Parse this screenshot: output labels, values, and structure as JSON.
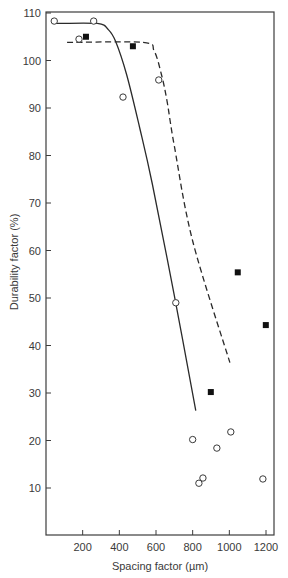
{
  "chart_data": {
    "type": "scatter",
    "title": "",
    "xlabel": "Spacing factor (µm)",
    "ylabel": "Durability factor (%)",
    "xlim": [
      0,
      1250
    ],
    "ylim": [
      0,
      110
    ],
    "x_ticks": [
      200,
      400,
      600,
      800,
      1000,
      1200
    ],
    "y_ticks": [
      10,
      20,
      30,
      40,
      50,
      60,
      70,
      80,
      90,
      100,
      110
    ],
    "grid": false,
    "legend": null,
    "series": [
      {
        "name": "open-circles",
        "marker": "open-circle",
        "points": [
          {
            "x": 45,
            "y": 108.3
          },
          {
            "x": 260,
            "y": 108.3
          },
          {
            "x": 180,
            "y": 104.5
          },
          {
            "x": 420,
            "y": 92.3
          },
          {
            "x": 615,
            "y": 95.9
          },
          {
            "x": 708,
            "y": 49.0
          },
          {
            "x": 800,
            "y": 20.2
          },
          {
            "x": 1008,
            "y": 21.8
          },
          {
            "x": 932,
            "y": 18.4
          },
          {
            "x": 856,
            "y": 12.1
          },
          {
            "x": 834,
            "y": 11.0
          },
          {
            "x": 1183,
            "y": 11.9
          }
        ]
      },
      {
        "name": "filled-squares",
        "marker": "filled-square",
        "points": [
          {
            "x": 218,
            "y": 105.0
          },
          {
            "x": 474,
            "y": 103.0
          },
          {
            "x": 1046,
            "y": 55.4
          },
          {
            "x": 1199,
            "y": 44.3
          },
          {
            "x": 899,
            "y": 30.2
          }
        ]
      }
    ],
    "curves": [
      {
        "name": "solid-fit-curve",
        "style": "solid",
        "points": [
          {
            "x": 45,
            "y": 107.8
          },
          {
            "x": 280,
            "y": 107.8
          },
          {
            "x": 340,
            "y": 106.5
          },
          {
            "x": 380,
            "y": 104.0
          },
          {
            "x": 440,
            "y": 97.0
          },
          {
            "x": 510,
            "y": 86.0
          },
          {
            "x": 580,
            "y": 74.0
          },
          {
            "x": 700,
            "y": 50.5
          },
          {
            "x": 817,
            "y": 26.3
          }
        ]
      },
      {
        "name": "dashed-fit-curve",
        "style": "dashed",
        "points": [
          {
            "x": 115,
            "y": 103.8
          },
          {
            "x": 530,
            "y": 103.8
          },
          {
            "x": 590,
            "y": 102.0
          },
          {
            "x": 630,
            "y": 97.0
          },
          {
            "x": 660,
            "y": 91.5
          },
          {
            "x": 700,
            "y": 82.0
          },
          {
            "x": 800,
            "y": 62.0
          },
          {
            "x": 1003,
            "y": 36.4
          }
        ]
      }
    ]
  }
}
